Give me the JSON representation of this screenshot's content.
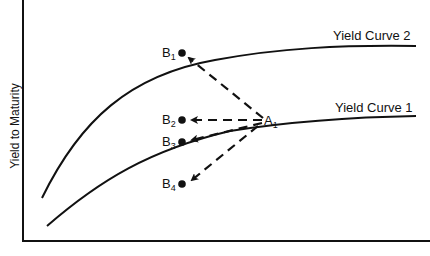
{
  "diagram": {
    "y_axis_label": "Yield to Maturity",
    "curves": [
      {
        "id": "yield-curve-1",
        "label": "Yield Curve 1"
      },
      {
        "id": "yield-curve-2",
        "label": "Yield Curve 2"
      }
    ],
    "points": {
      "A": {
        "base": "A",
        "sub": "1"
      },
      "B1": {
        "base": "B",
        "sub": "1"
      },
      "B2": {
        "base": "B",
        "sub": "2"
      },
      "B3": {
        "base": "B",
        "sub": "3"
      },
      "B4": {
        "base": "B",
        "sub": "4"
      }
    },
    "colors": {
      "ink": "#111111",
      "background": "#ffffff"
    }
  }
}
